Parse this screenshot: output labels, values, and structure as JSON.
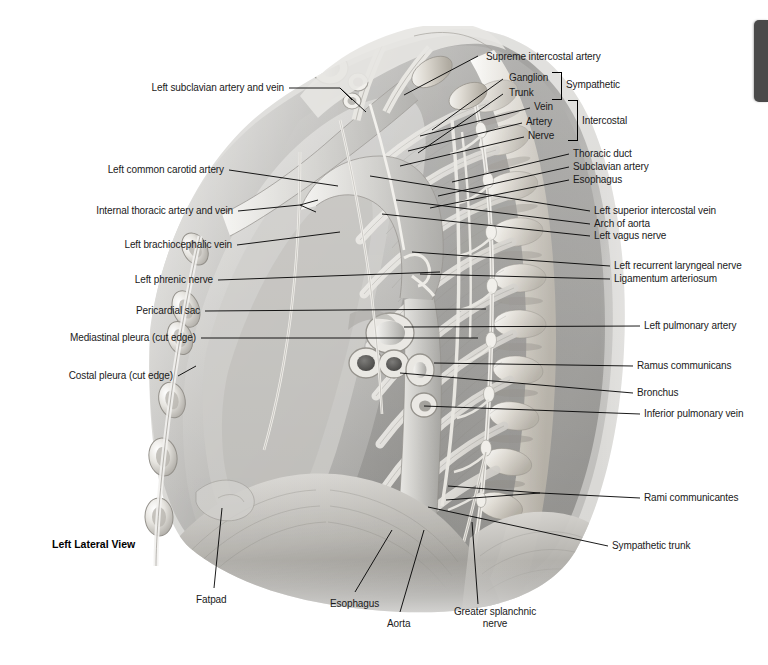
{
  "plate": {
    "view_title": "Left Lateral View",
    "background_color": "#ffffff",
    "edge_tab_color": "#4a4a4a",
    "width": 768,
    "height": 665
  },
  "labels_left": [
    {
      "id": "left-subclavian-artery-and-vein",
      "text": "Left subclavian artery and vein",
      "x": 150,
      "y": 87,
      "anchor_x": 289,
      "anchor_y": 93
    },
    {
      "id": "left-common-carotid-artery",
      "text": "Left common carotid artery",
      "x": 112,
      "y": 167,
      "anchor_x": 229,
      "anchor_y": 172
    },
    {
      "id": "internal-thoracic-artery-and-vein",
      "text": "Internal thoracic artery and vein",
      "x": 84,
      "y": 205,
      "anchor_x": 238,
      "anchor_y": 210
    },
    {
      "id": "left-brachiocephalic-vein",
      "text": "Left brachiocephalic vein",
      "x": 121,
      "y": 239,
      "anchor_x": 237,
      "anchor_y": 244
    },
    {
      "id": "left-phrenic-nerve",
      "text": "Left phrenic nerve",
      "x": 114,
      "y": 274,
      "anchor_x": 218,
      "anchor_y": 279
    },
    {
      "id": "pericardial-sac",
      "text": "Pericardial sac",
      "x": 116,
      "y": 305,
      "anchor_x": 205,
      "anchor_y": 310
    },
    {
      "id": "mediastinal-pleura-cut-edge",
      "text": "Mediastinal pleura (cut edge)",
      "x": 47,
      "y": 332,
      "anchor_x": 201,
      "anchor_y": 337
    },
    {
      "id": "costal-pleura-cut-edge",
      "text": "Costal pleura (cut edge)",
      "x": 57,
      "y": 370,
      "anchor_x": 178,
      "anchor_y": 375
    }
  ],
  "labels_right": [
    {
      "id": "supreme-intercostal-artery",
      "text": "Supreme intercostal artery",
      "x": 486,
      "y": 51,
      "anchor_x": 478,
      "anchor_y": 56
    },
    {
      "id": "ganglion",
      "text": "Ganglion",
      "x": 509,
      "y": 73,
      "anchor_x": 503,
      "anchor_y": 79
    },
    {
      "id": "trunk",
      "text": "Trunk",
      "x": 509,
      "y": 88,
      "anchor_x": 503,
      "anchor_y": 94
    },
    {
      "id": "sympathetic",
      "text": "Sympathetic",
      "x": 566,
      "y": 80,
      "anchor_x": null,
      "anchor_y": null
    },
    {
      "id": "vein",
      "text": "Vein",
      "x": 534,
      "y": 102,
      "anchor_x": 530,
      "anchor_y": 108
    },
    {
      "id": "artery",
      "text": "Artery",
      "x": 526,
      "y": 117,
      "anchor_x": 522,
      "anchor_y": 123
    },
    {
      "id": "nerve",
      "text": "Nerve",
      "x": 528,
      "y": 131,
      "anchor_x": 524,
      "anchor_y": 137
    },
    {
      "id": "intercostal",
      "text": "Intercostal",
      "x": 582,
      "y": 117,
      "anchor_x": null,
      "anchor_y": null
    },
    {
      "id": "thoracic-duct",
      "text": "Thoracic duct",
      "x": 573,
      "y": 149,
      "anchor_x": 569,
      "anchor_y": 154
    },
    {
      "id": "subclavian-artery",
      "text": "Subclavian artery",
      "x": 573,
      "y": 162,
      "anchor_x": 569,
      "anchor_y": 167
    },
    {
      "id": "esophagus-upper",
      "text": "Esophagus",
      "x": 573,
      "y": 175,
      "anchor_x": 569,
      "anchor_y": 180
    },
    {
      "id": "left-superior-intercostal-vein",
      "text": "Left superior intercostal vein",
      "x": 594,
      "y": 206,
      "anchor_x": 590,
      "anchor_y": 211
    },
    {
      "id": "arch-of-aorta",
      "text": "Arch of aorta",
      "x": 594,
      "y": 219,
      "anchor_x": 590,
      "anchor_y": 224
    },
    {
      "id": "left-vagus-nerve",
      "text": "Left vagus nerve",
      "x": 594,
      "y": 231,
      "anchor_x": 590,
      "anchor_y": 236
    },
    {
      "id": "left-recurrent-laryngeal-nerve",
      "text": "Left recurrent laryngeal nerve",
      "x": 614,
      "y": 261,
      "anchor_x": 610,
      "anchor_y": 266
    },
    {
      "id": "ligamentum-arteriosum",
      "text": "Ligamentum arteriosum",
      "x": 614,
      "y": 274,
      "anchor_x": 610,
      "anchor_y": 279
    },
    {
      "id": "left-pulmonary-artery",
      "text": "Left pulmonary artery",
      "x": 644,
      "y": 321,
      "anchor_x": 640,
      "anchor_y": 326
    },
    {
      "id": "ramus-communicans",
      "text": "Ramus communicans",
      "x": 637,
      "y": 361,
      "anchor_x": 633,
      "anchor_y": 366
    },
    {
      "id": "bronchus",
      "text": "Bronchus",
      "x": 637,
      "y": 388,
      "anchor_x": 633,
      "anchor_y": 393
    },
    {
      "id": "inferior-pulmonary-vein",
      "text": "Inferior pulmonary vein",
      "x": 644,
      "y": 409,
      "anchor_x": 640,
      "anchor_y": 414
    },
    {
      "id": "rami-communicantes",
      "text": "Rami communicantes",
      "x": 644,
      "y": 493,
      "anchor_x": 640,
      "anchor_y": 498
    },
    {
      "id": "sympathetic-trunk",
      "text": "Sympathetic trunk",
      "x": 612,
      "y": 541,
      "anchor_x": 608,
      "anchor_y": 546
    }
  ],
  "labels_bottom": [
    {
      "id": "fatpad",
      "text": "Fatpad",
      "x": 196,
      "y": 594,
      "anchor_x": 214,
      "anchor_y": 590
    },
    {
      "id": "esophagus-lower",
      "text": "Esophagus",
      "x": 330,
      "y": 598,
      "anchor_x": 355,
      "anchor_y": 594
    },
    {
      "id": "aorta",
      "text": "Aorta",
      "x": 387,
      "y": 618,
      "anchor_x": 400,
      "anchor_y": 614
    },
    {
      "id": "greater-splanchnic-nerve-line1",
      "text": "Greater splanchnic",
      "x": 449,
      "y": 608,
      "anchor_x": 0,
      "anchor_y": 0
    },
    {
      "id": "greater-splanchnic-nerve-line2",
      "text": "nerve",
      "x": 486,
      "y": 620,
      "anchor_x": 0,
      "anchor_y": 0
    }
  ],
  "brackets": [
    {
      "id": "sympathetic-bracket",
      "x": 552,
      "y": 72,
      "width": 10,
      "height": 28
    },
    {
      "id": "intercostal-bracket",
      "x": 568,
      "y": 100,
      "width": 10,
      "height": 41
    }
  ]
}
